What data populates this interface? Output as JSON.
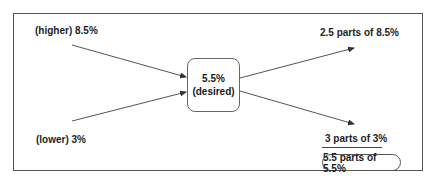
{
  "diagram": {
    "inputs": {
      "higher": "(higher) 8.5%",
      "lower": "(lower) 3%"
    },
    "center": {
      "value": "5.5%",
      "caption": "(desired)"
    },
    "outputs": {
      "top": "2.5 parts of 8.5%",
      "bottom": "3 parts of 3%",
      "total": "5.5 parts of 5.5%"
    },
    "colors": {
      "line": "#555555",
      "text": "#1e1e1e",
      "background": "#ffffff"
    }
  }
}
